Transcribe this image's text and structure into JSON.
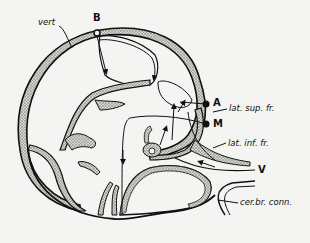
{
  "diagram": {
    "type": "anatomical cross-section",
    "colors": {
      "outline": "#111111",
      "stipple_fill": "#b8b8b4",
      "background": "#f4f4f2"
    },
    "labels": {
      "vert": "vert",
      "B": "B",
      "A": "A",
      "M": "M",
      "lat_sup_fr": "lat. sup. fr.",
      "lat_inf_fr": "lat. inf. fr.",
      "V": "V",
      "cer_br_conn": "cer.br. conn."
    }
  }
}
